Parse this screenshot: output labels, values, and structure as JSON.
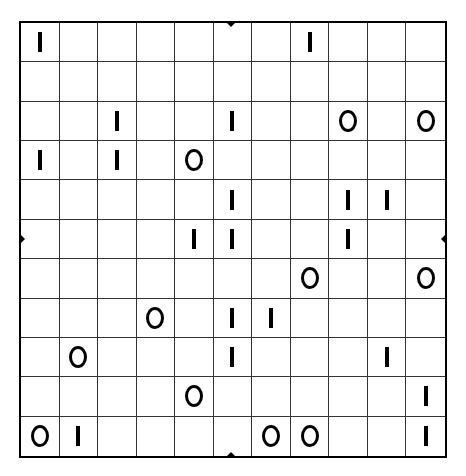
{
  "puzzle": {
    "type": "binary-grid",
    "rows": 11,
    "cols": 11,
    "symbols": {
      "one": "I",
      "zero": "O"
    },
    "grid": [
      [
        "I",
        "",
        "",
        "",
        "",
        "",
        "",
        "I",
        "",
        "",
        ""
      ],
      [
        "",
        "",
        "",
        "",
        "",
        "",
        "",
        "",
        "",
        "",
        ""
      ],
      [
        "",
        "",
        "I",
        "",
        "",
        "I",
        "",
        "",
        "O",
        "",
        "O"
      ],
      [
        "I",
        "",
        "I",
        "",
        "O",
        "",
        "",
        "",
        "",
        "",
        ""
      ],
      [
        "",
        "",
        "",
        "",
        "",
        "I",
        "",
        "",
        "I",
        "I",
        ""
      ],
      [
        "",
        "",
        "",
        "",
        "I",
        "I",
        "",
        "",
        "I",
        "",
        ""
      ],
      [
        "",
        "",
        "",
        "",
        "",
        "",
        "",
        "O",
        "",
        "",
        "O"
      ],
      [
        "",
        "",
        "",
        "O",
        "",
        "I",
        "I",
        "",
        "",
        "",
        ""
      ],
      [
        "",
        "O",
        "",
        "",
        "",
        "I",
        "",
        "",
        "",
        "I",
        ""
      ],
      [
        "",
        "",
        "",
        "",
        "O",
        "",
        "",
        "",
        "",
        "",
        "I"
      ],
      [
        "O",
        "I",
        "",
        "",
        "",
        "",
        "O",
        "O",
        "",
        "",
        "I"
      ]
    ],
    "edge_markers": [
      "top-center",
      "bottom-center",
      "left-middle",
      "right-middle"
    ]
  }
}
